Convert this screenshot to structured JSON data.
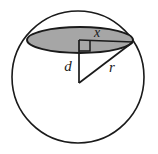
{
  "figure": {
    "canvas": {
      "width": 158,
      "height": 154,
      "background": "#ffffff"
    },
    "labels": {
      "chord_half_length": "x",
      "distance_from_center": "d",
      "sphere_radius": "r"
    },
    "colors": {
      "stroke": "#1a1a1a",
      "disk_fill": "#a6a6a6",
      "disk_stroke": "#1a1a1a",
      "label_color": "#1a1a1a",
      "background": "#ffffff"
    },
    "geometry": {
      "sphere_circle": {
        "cx": 78,
        "cy": 77,
        "r": 66
      },
      "cross_section_ellipse": {
        "cx": 80,
        "cy": 40,
        "rx": 53,
        "ry": 13
      },
      "sphere_center_point": {
        "x": 79,
        "y": 83
      },
      "disk_center_point": {
        "x": 79,
        "y": 40
      },
      "disk_edge_point": {
        "x": 133,
        "y": 42
      },
      "right_angle_marker": {
        "x": 79,
        "y": 40,
        "size": 11
      }
    },
    "label_positions": {
      "x": {
        "x": 97,
        "y": 37
      },
      "d": {
        "x": 66,
        "y": 70
      },
      "r": {
        "x": 109,
        "y": 72
      }
    }
  }
}
